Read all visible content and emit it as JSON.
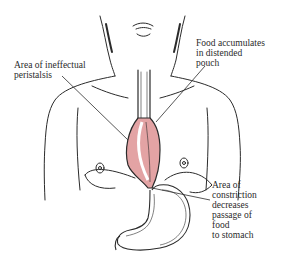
{
  "diagram": {
    "colors": {
      "pouch_fill": "#e3a3a4",
      "line": "#2b2b2b",
      "background": "#ffffff"
    },
    "labels": {
      "peristalsis": {
        "lines": [
          "Area of ineffectual",
          "peristalsis"
        ]
      },
      "food": {
        "lines": [
          "Food accumulates",
          "in distended",
          "pouch"
        ]
      },
      "constriction": {
        "lines": [
          "Area of",
          "constriction",
          "decreases",
          "passage of",
          "food",
          "to stomach"
        ]
      }
    }
  }
}
